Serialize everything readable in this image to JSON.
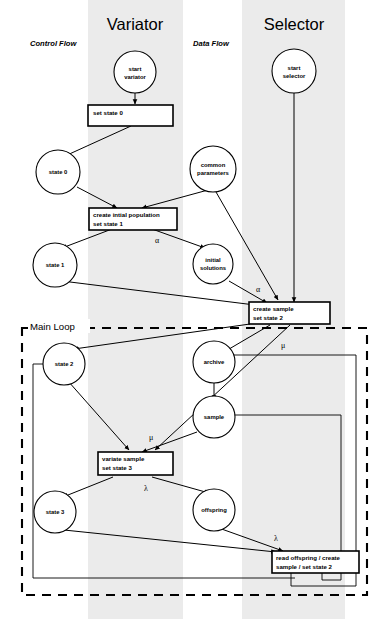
{
  "figure": {
    "lanes": [
      {
        "id": "variator",
        "title": "Variator"
      },
      {
        "id": "selector",
        "title": "Selector"
      }
    ],
    "flow_labels": [
      {
        "id": "control-flow",
        "text": "Control Flow"
      },
      {
        "id": "data-flow",
        "text": "Data Flow"
      }
    ],
    "loop": {
      "label": "Main Loop"
    },
    "nodes": {
      "start_variator": {
        "line1": "start",
        "line2": "variator"
      },
      "start_selector": {
        "line1": "start",
        "line2": "selector"
      },
      "state0": {
        "line1": "state 0"
      },
      "state1": {
        "line1": "state 1"
      },
      "state2": {
        "line1": "state 2"
      },
      "state3": {
        "line1": "state 3"
      },
      "common_parameters": {
        "line1": "common",
        "line2": "parameters"
      },
      "initial_solutions": {
        "line1": "initial",
        "line2": "solutions"
      },
      "archive": {
        "line1": "archive"
      },
      "sample": {
        "line1": "sample"
      },
      "offspring": {
        "line1": "offspring"
      }
    },
    "boxes": {
      "set_state_0": {
        "line1": "set state 0",
        "line2": ""
      },
      "create_initial_population": {
        "line1": "create intial population",
        "line2": "set state 1"
      },
      "create_sample": {
        "line1": "create sample",
        "line2": "set state 2"
      },
      "variate_sample": {
        "line1": "variate sample",
        "line2": "set state 3"
      },
      "read_offspring": {
        "line1": "read offspring / create",
        "line2": "sample / set state 2"
      }
    },
    "edge_labels": {
      "alpha_1": "α",
      "alpha_2": "α",
      "mu_1": "μ",
      "mu_2": "μ",
      "mu_3": "μ",
      "lambda_1": "λ",
      "lambda_2": "λ"
    },
    "colors": {
      "lane_band": "#ebebeb",
      "stroke": "#000000",
      "background": "#ffffff"
    }
  }
}
